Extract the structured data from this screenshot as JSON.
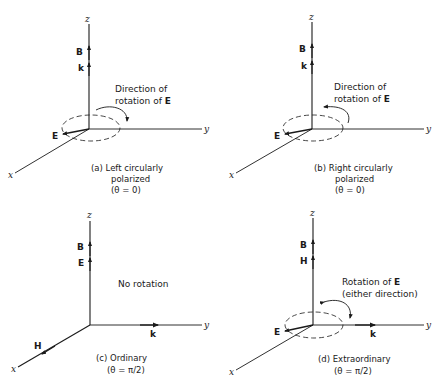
{
  "figure": {
    "panels": [
      {
        "id": "a",
        "axes": {
          "z": "z",
          "y": "y",
          "x": "x"
        },
        "vectors": [
          "B",
          "k",
          "E"
        ],
        "annotation_line1": "Direction of",
        "annotation_line2_prefix": "rotation of ",
        "annotation_line2_vec": "E",
        "caption_line1": "(a) Left circularly",
        "caption_line2": "polarized",
        "caption_line3": "(θ = 0)",
        "rotation": "counter-arrow-right"
      },
      {
        "id": "b",
        "axes": {
          "z": "z",
          "y": "y",
          "x": "x"
        },
        "vectors": [
          "B",
          "k",
          "E"
        ],
        "annotation_line1": "Direction of",
        "annotation_line2_prefix": "rotation of ",
        "annotation_line2_vec": "E",
        "caption_line1": "(b) Right circularly",
        "caption_line2": "polarized",
        "caption_line3": "(θ = 0)",
        "rotation": "arrow-left"
      },
      {
        "id": "c",
        "axes": {
          "z": "z",
          "y": "y",
          "x": "x"
        },
        "vectors": [
          "B",
          "E",
          "k",
          "H"
        ],
        "annotation_line1": "No rotation",
        "caption_line1": "(c) Ordinary",
        "caption_line2": "(θ = π/2)"
      },
      {
        "id": "d",
        "axes": {
          "z": "z",
          "y": "y",
          "x": "x"
        },
        "vectors": [
          "B",
          "H",
          "k",
          "E"
        ],
        "annotation_line1_prefix": "Rotation of ",
        "annotation_line1_vec": "E",
        "annotation_line2": "(either direction)",
        "caption_line1": "(d) Extraordinary",
        "caption_line2": "(θ = π/2)",
        "rotation": "both-directions"
      }
    ]
  }
}
